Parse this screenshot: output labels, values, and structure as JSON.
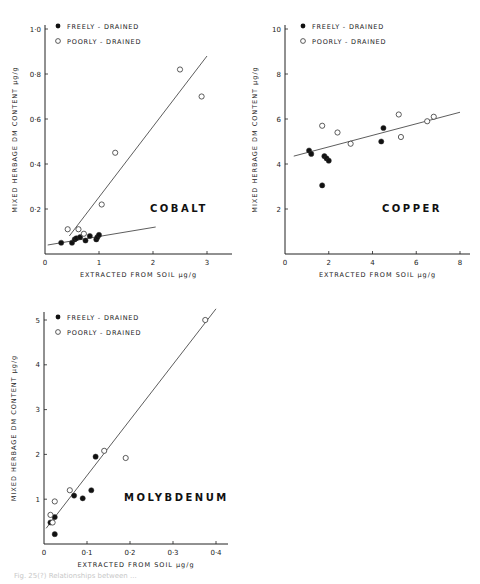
{
  "legend": {
    "filled": "FREELY - DRAINED",
    "open": "POORLY - DRAINED"
  },
  "xlabel": "EXTRACTED FROM SOIL  µg/g",
  "ylabel": "MIXED HERBAGE DM CONTENT  µg/g",
  "caption": "Fig. 25(?)  Relationships between ...",
  "chart_data": [
    {
      "type": "scatter",
      "title": "COBALT",
      "xlabel": "EXTRACTED FROM SOIL µg/g",
      "ylabel": "MIXED HERBAGE DM CONTENT µg/g",
      "xticks": [
        "0",
        "1",
        "2",
        "3"
      ],
      "yticks": [
        "0·2",
        "0·4",
        "0·6",
        "0·8",
        "1·0"
      ],
      "xlim": [
        0,
        3.3
      ],
      "ylim": [
        0,
        1.05
      ],
      "series": [
        {
          "name": "FREELY - DRAINED",
          "marker": "filled",
          "x": [
            0.3,
            0.5,
            0.55,
            0.58,
            0.65,
            0.75,
            0.83,
            0.95,
            0.97,
            1.0
          ],
          "y": [
            0.05,
            0.05,
            0.065,
            0.07,
            0.075,
            0.06,
            0.08,
            0.065,
            0.075,
            0.085
          ]
        },
        {
          "name": "POORLY - DRAINED",
          "marker": "open",
          "x": [
            0.42,
            0.62,
            0.72,
            1.05,
            1.3,
            2.5,
            2.9
          ],
          "y": [
            0.11,
            0.11,
            0.09,
            0.22,
            0.45,
            0.82,
            0.7
          ]
        }
      ],
      "fit_lines": [
        {
          "series": "FREELY - DRAINED",
          "x": [
            0.05,
            2.05
          ],
          "y": [
            0.04,
            0.12
          ]
        },
        {
          "series": "POORLY - DRAINED",
          "x": [
            0.45,
            3.0
          ],
          "y": [
            0.08,
            0.88
          ]
        }
      ],
      "grid": false,
      "legend_position": "top-left"
    },
    {
      "type": "scatter",
      "title": "COPPER",
      "xlabel": "EXTRACTED FROM SOIL µg/g",
      "ylabel": "MIXED HERBAGE DM CONTENT µg/g",
      "xticks": [
        "0",
        "2",
        "4",
        "6",
        "8"
      ],
      "yticks": [
        "2",
        "4",
        "6",
        "8",
        "10"
      ],
      "xlim": [
        0,
        8.5
      ],
      "ylim": [
        0,
        10.5
      ],
      "series": [
        {
          "name": "FREELY - DRAINED",
          "marker": "filled",
          "x": [
            1.1,
            1.2,
            1.7,
            1.8,
            1.9,
            2.0,
            4.4,
            4.5
          ],
          "y": [
            4.6,
            4.45,
            3.05,
            4.35,
            4.25,
            4.15,
            5.0,
            5.6
          ]
        },
        {
          "name": "POORLY - DRAINED",
          "marker": "open",
          "x": [
            1.7,
            2.4,
            3.0,
            5.2,
            5.3,
            6.5,
            6.8
          ],
          "y": [
            5.7,
            5.4,
            4.9,
            6.2,
            5.2,
            5.9,
            6.1
          ]
        }
      ],
      "fit_lines": [
        {
          "series": "all",
          "x": [
            0.4,
            8.0
          ],
          "y": [
            4.35,
            6.3
          ]
        }
      ],
      "grid": false,
      "legend_position": "top-left"
    },
    {
      "type": "scatter",
      "title": "MOLYBDENUM",
      "xlabel": "EXTRACTED FROM SOIL µg/g",
      "ylabel": "MIXED HERBAGE DM CONTENT µg/g",
      "xticks": [
        "0",
        "0·1",
        "0·2",
        "0·3",
        "0·4"
      ],
      "yticks": [
        "1",
        "2",
        "3",
        "4",
        "5"
      ],
      "xlim": [
        0,
        0.42
      ],
      "ylim": [
        0,
        5.2
      ],
      "series": [
        {
          "name": "FREELY - DRAINED",
          "marker": "filled",
          "x": [
            0.015,
            0.025,
            0.025,
            0.07,
            0.09,
            0.11,
            0.12
          ],
          "y": [
            0.48,
            0.6,
            0.22,
            1.08,
            1.02,
            1.2,
            1.95
          ]
        },
        {
          "name": "POORLY - DRAINED",
          "marker": "open",
          "x": [
            0.015,
            0.02,
            0.025,
            0.06,
            0.14,
            0.19,
            0.375
          ],
          "y": [
            0.65,
            0.48,
            0.95,
            1.2,
            2.08,
            1.92,
            5.0
          ]
        }
      ],
      "fit_lines": [
        {
          "series": "all",
          "x": [
            0.005,
            0.4
          ],
          "y": [
            0.35,
            5.25
          ]
        }
      ],
      "grid": false,
      "legend_position": "top-left"
    }
  ]
}
